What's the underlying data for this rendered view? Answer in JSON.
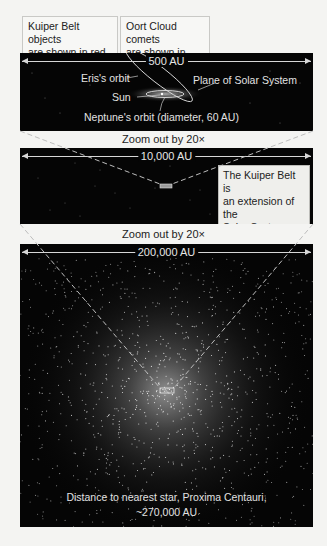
{
  "legend_boxes": {
    "kuiper": {
      "line1": "Kuiper Belt objects",
      "line2": "are shown in red."
    },
    "oort": {
      "line1": "Oort Cloud comets",
      "line2": "are shown in green."
    }
  },
  "panels": [
    {
      "id": "panel-1",
      "scale_label": "500 AU",
      "annotations": {
        "eris_orbit": "Eris's orbit",
        "plane": "Plane of Solar System",
        "sun": "Sun",
        "neptune": "Neptune's orbit (diameter, 60 AU)"
      }
    },
    {
      "id": "panel-2",
      "scale_label": "10,000 AU",
      "note": {
        "line1": "The Kuiper Belt is",
        "line2": "an extension of the",
        "line3": "Solar System disk."
      }
    },
    {
      "id": "panel-3",
      "scale_label": "200,000 AU",
      "bottom_text": {
        "line1": "Distance to nearest star, Proxima Centauri,",
        "line2": "~270,000 AU"
      }
    }
  ],
  "zoom_labels": {
    "first": "Zoom out by 20×",
    "second": "Zoom out by 20×"
  },
  "colors": {
    "panel_bg": "#050505",
    "page_bg": "#f4f4f2",
    "line": "#d6d6d6",
    "kuiper": "#c0392b",
    "oort": "#3e9a4a"
  }
}
